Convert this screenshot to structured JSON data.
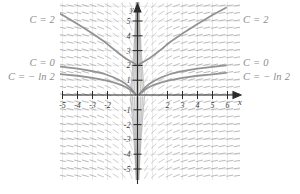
{
  "figure": {
    "title": "",
    "type": "slope-field-with-solution-curves",
    "background_color": "#ffffff",
    "plot_area": {
      "x": 60,
      "y": 2,
      "width": 180,
      "height": 178
    },
    "grid": {
      "visible": true,
      "color": "#dcdcdc",
      "spacing_px": 15
    },
    "axis_color": "#2b2b2b",
    "field_color": "#9a9a9a",
    "curve_color": "#8d8d8d"
  },
  "axes": {
    "x": {
      "label": "x",
      "tick_labels": [
        "-5",
        "-4",
        "-3",
        "-2",
        "2",
        "3",
        "4",
        "5",
        "6"
      ],
      "tick_values": [
        -5,
        -4,
        -3,
        -2,
        2,
        3,
        4,
        5,
        6
      ],
      "range": [
        -5.6,
        6.6
      ],
      "arrow": true
    },
    "y": {
      "label": "y",
      "tick_labels": [
        "5",
        "4",
        "3",
        "2",
        "1",
        "-1",
        "-2",
        "-3",
        "-4",
        "-5"
      ],
      "tick_values": [
        5,
        4,
        3,
        2,
        1,
        -1,
        -2,
        -3,
        -4,
        -5
      ],
      "range": [
        -5.9,
        5.9
      ],
      "arrow": true
    }
  },
  "curve_labels": {
    "left": [
      {
        "text": "C = 2",
        "x": 55,
        "y": 20
      },
      {
        "text": "C = 0",
        "x": 55,
        "y": 63
      },
      {
        "text": "C = − ln 2",
        "x": 55,
        "y": 77
      }
    ],
    "right": [
      {
        "text": "C = 2",
        "x": 243,
        "y": 20
      },
      {
        "text": "C = 0",
        "x": 243,
        "y": 63
      },
      {
        "text": "C = − ln 2",
        "x": 243,
        "y": 77
      }
    ]
  },
  "chart_data": {
    "type": "line",
    "title": "",
    "xlabel": "x",
    "ylabel": "y",
    "xlim": [
      -5.6,
      6.6
    ],
    "ylim": [
      -5.9,
      5.9
    ],
    "grid": true,
    "legend_position": "inline-endpoints",
    "annotations": [
      "C = 2",
      "C = 0",
      "C = − ln 2"
    ],
    "series": [
      {
        "name": "C = 2",
        "branch": "left",
        "x": [
          -5.6,
          -5.0,
          -4.0,
          -3.0,
          -2.2,
          -1.6,
          -1.1,
          -0.75,
          -0.5,
          -0.32,
          -0.2,
          -0.12
        ],
        "y": [
          5.7,
          5.4,
          4.8,
          4.15,
          3.6,
          3.1,
          2.7,
          2.45,
          2.3,
          2.2,
          2.13,
          2.08
        ]
      },
      {
        "name": "C = 2",
        "branch": "right",
        "x": [
          0.12,
          0.2,
          0.32,
          0.5,
          0.75,
          1.1,
          1.6,
          2.2,
          3.0,
          4.0,
          5.0,
          5.9
        ],
        "y": [
          2.08,
          2.13,
          2.2,
          2.3,
          2.45,
          2.7,
          3.1,
          3.6,
          4.15,
          4.8,
          5.4,
          5.9
        ]
      },
      {
        "name": "C = 0",
        "branch": "left",
        "x": [
          -5.6,
          -5.0,
          -4.0,
          -3.0,
          -2.2,
          -1.6,
          -1.1,
          -0.75,
          -0.5,
          -0.32,
          -0.2,
          -0.12
        ],
        "y": [
          1.95,
          1.9,
          1.78,
          1.62,
          1.42,
          1.2,
          0.95,
          0.72,
          0.5,
          0.3,
          0.15,
          0.05
        ]
      },
      {
        "name": "C = 0",
        "branch": "right",
        "x": [
          0.12,
          0.2,
          0.32,
          0.5,
          0.75,
          1.1,
          1.6,
          2.2,
          3.0,
          4.0,
          5.0,
          5.9
        ],
        "y": [
          0.05,
          0.15,
          0.3,
          0.5,
          0.72,
          0.95,
          1.2,
          1.42,
          1.62,
          1.78,
          1.9,
          2.0
        ]
      },
      {
        "name": "C = − ln 2",
        "branch": "left",
        "x": [
          -5.6,
          -5.0,
          -4.0,
          -3.0,
          -2.2,
          -1.6,
          -1.1,
          -0.75,
          -0.5,
          -0.32,
          -0.2,
          -0.12
        ],
        "y": [
          1.45,
          1.4,
          1.3,
          1.15,
          1.0,
          0.85,
          0.68,
          0.52,
          0.36,
          0.22,
          0.12,
          0.04
        ]
      },
      {
        "name": "C = − ln 2",
        "branch": "right",
        "x": [
          0.12,
          0.2,
          0.32,
          0.5,
          0.75,
          1.1,
          1.6,
          2.2,
          3.0,
          4.0,
          5.0,
          5.9
        ],
        "y": [
          0.04,
          0.12,
          0.22,
          0.36,
          0.52,
          0.68,
          0.85,
          1.0,
          1.15,
          1.3,
          1.4,
          1.5
        ]
      }
    ]
  }
}
